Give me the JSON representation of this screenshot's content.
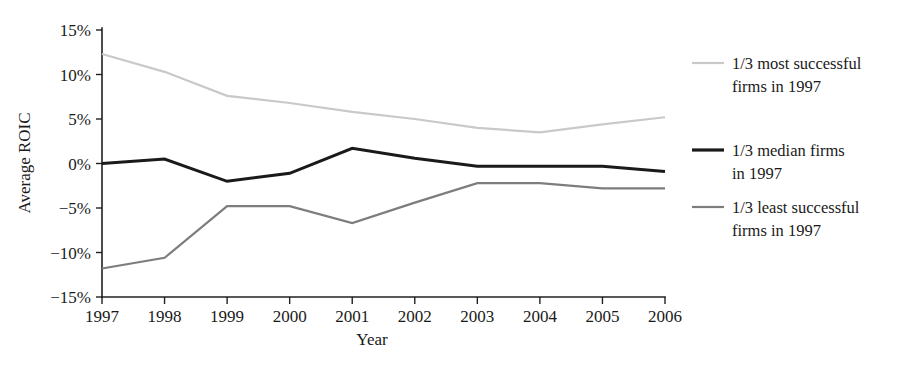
{
  "chart_data": {
    "type": "line",
    "title": "",
    "xlabel": "Year",
    "ylabel": "Average ROIC",
    "categories": [
      "1997",
      "1998",
      "1999",
      "2000",
      "2001",
      "2002",
      "2003",
      "2004",
      "2005",
      "2006"
    ],
    "x": [
      1997,
      1998,
      1999,
      2000,
      2001,
      2002,
      2003,
      2004,
      2005,
      2006
    ],
    "ylim": [
      -15,
      15
    ],
    "xlim": [
      1997,
      2006
    ],
    "ytick_labels": [
      "15%",
      "10%",
      "5%",
      "0%",
      "−5%",
      "−10%",
      "−15%"
    ],
    "ytick_values": [
      15,
      10,
      5,
      0,
      -5,
      -10,
      -15
    ],
    "grid": false,
    "legend_position": "right",
    "units": "percent",
    "series": [
      {
        "name": "1/3 most successful firms in 1997",
        "color": "#c9c9c9",
        "stroke_width": 2.2,
        "values": [
          12.3,
          10.3,
          7.6,
          6.8,
          5.8,
          5.0,
          4.0,
          3.5,
          4.4,
          5.2
        ]
      },
      {
        "name": "1/3 median firms in 1997",
        "color": "#1a1a1a",
        "stroke_width": 3.0,
        "values": [
          0.0,
          0.5,
          -2.0,
          -1.1,
          1.7,
          0.6,
          -0.3,
          -0.3,
          -0.3,
          -0.9
        ]
      },
      {
        "name": "1/3 least successful firms in 1997",
        "color": "#7d7d7d",
        "stroke_width": 2.2,
        "values": [
          -11.8,
          -10.6,
          -4.8,
          -4.8,
          -6.7,
          -4.4,
          -2.2,
          -2.2,
          -2.8,
          -2.8
        ]
      }
    ]
  },
  "legend": {
    "items": [
      {
        "line1": "1/3 most successful",
        "line2": "firms in 1997",
        "color": "#c9c9c9",
        "width": 2.2
      },
      {
        "line1": "1/3 median firms",
        "line2": "in 1997",
        "color": "#1a1a1a",
        "width": 3.2
      },
      {
        "line1": "1/3 least successful",
        "line2": "firms in 1997",
        "color": "#7d7d7d",
        "width": 2.2
      }
    ]
  },
  "axes": {
    "y_title": "Average ROIC",
    "x_title": "Year"
  },
  "geometry": {
    "plot_left": 102,
    "plot_right": 665,
    "plot_top": 30,
    "plot_bottom": 297,
    "y_max": 15,
    "y_min": -15
  }
}
